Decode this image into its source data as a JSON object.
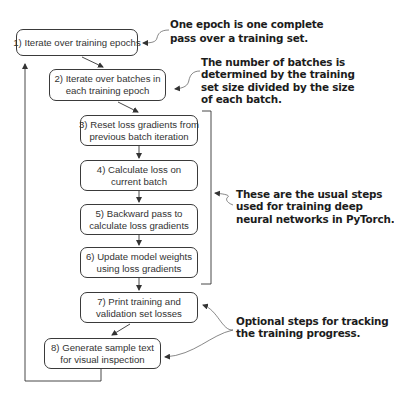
{
  "diagram": {
    "steps": [
      {
        "label": "1) Iterate over training epochs"
      },
      {
        "label": "2) Iterate over batches in\neach training epoch"
      },
      {
        "label": "3) Reset loss gradients from\nprevious batch iteration"
      },
      {
        "label": "4) Calculate loss on\ncurrent batch"
      },
      {
        "label": "5) Backward pass to\ncalculate loss gradients"
      },
      {
        "label": "6) Update model weights\nusing loss gradients"
      },
      {
        "label": "7) Print training and\nvalidation set losses"
      },
      {
        "label": "8) Generate sample text\nfor visual inspection"
      }
    ],
    "annotations": [
      {
        "text": "One epoch is one complete\npass over a training set.",
        "target": "step-1"
      },
      {
        "text": "The number of batches is\ndetermined by the training\nset size divided by the size\nof each batch.",
        "target": "step-2"
      },
      {
        "text": "These are the usual steps\nused for training deep\nneural networks in PyTorch.",
        "target": "steps-3-6"
      },
      {
        "text": "Optional steps for tracking\nthe training progress.",
        "target": "steps-7-8"
      }
    ],
    "colors": {
      "box_border": "#3a3a3a",
      "text": "#333333",
      "annotation_text": "#1c1c1c",
      "background": "#ffffff"
    }
  }
}
